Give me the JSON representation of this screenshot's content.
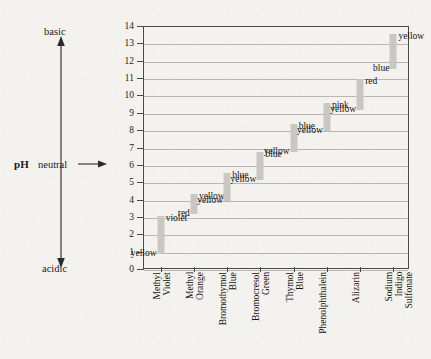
{
  "axis": {
    "ph_label": "pH",
    "basic_label": "basic",
    "neutral_label": "neutral",
    "acidic_label": "acidic"
  },
  "chart_data": {
    "type": "bar",
    "title": "",
    "xlabel": "",
    "ylabel": "pH",
    "ylim": [
      0,
      14
    ],
    "grid": true,
    "legend": "none",
    "yticks": [
      0,
      1,
      2,
      3,
      4,
      5,
      6,
      7,
      8,
      9,
      10,
      11,
      12,
      13,
      14
    ],
    "categories": [
      "Methyl Violet",
      "Methyl Orange",
      "Bromothymol Blue",
      "Bromocresol Green",
      "Thymol Blue",
      "Phenolphthalein",
      "Alizarin",
      "Sodium Indigo Sulfonate"
    ],
    "bars": [
      {
        "name": "Methyl Violet",
        "low": 0.9,
        "high": 3.1,
        "acid_color": "yellow",
        "base_color": "violet"
      },
      {
        "name": "Methyl Orange",
        "low": 3.2,
        "high": 4.4,
        "acid_color": "red",
        "base_color": "yellow"
      },
      {
        "name": "Bromothymol Blue",
        "low": 4.0,
        "high": 5.6,
        "acid_color": "yellow",
        "base_color": "blue"
      },
      {
        "name": "Bromocresol Green",
        "low": 5.2,
        "high": 6.8,
        "acid_color": "yellow",
        "base_color": "blue"
      },
      {
        "name": "Thymol Blue",
        "low": 6.8,
        "high": 8.4,
        "acid_color": "yellow",
        "base_color": "blue"
      },
      {
        "name": "Phenolphthalein",
        "low": 8.0,
        "high": 9.6,
        "acid_color": "yellow",
        "base_color": "pink"
      },
      {
        "name": "Alizarin",
        "low": 9.2,
        "high": 11.0,
        "acid_color": "yellow",
        "base_color": "red"
      },
      {
        "name": "Sodium Indigo Sulfonate",
        "low": 11.6,
        "high": 13.6,
        "acid_color": "blue",
        "base_color": "yellow"
      }
    ]
  },
  "colors": {
    "bar_fill": "#c9c7c2",
    "grid": "#b9b6b0",
    "frame": "#4a4a4a",
    "paper": "#f4f2ee",
    "text": "#141414"
  }
}
